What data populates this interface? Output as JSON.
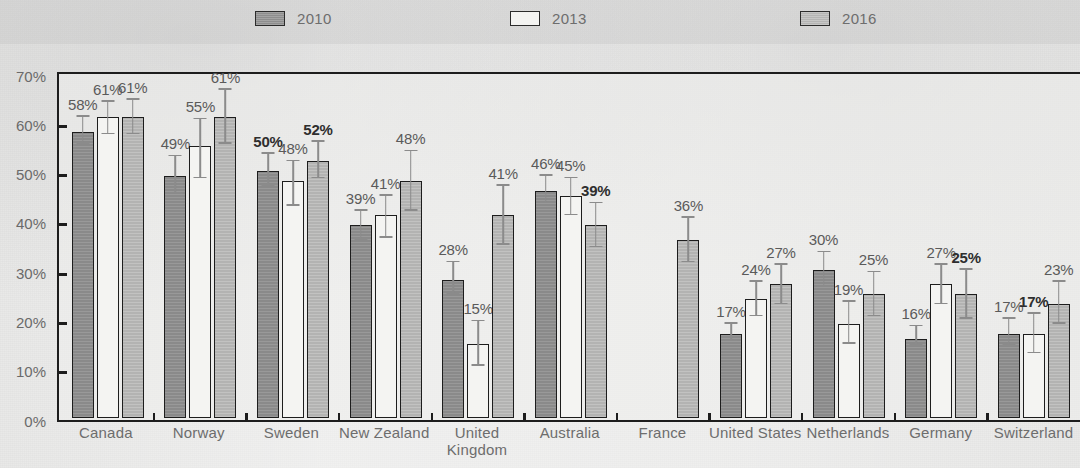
{
  "chart_data": {
    "type": "bar",
    "title": "",
    "subtitle": "",
    "xlabel": "",
    "ylabel": "",
    "ylim": [
      0,
      70
    ],
    "grid": false,
    "legend_position": "top",
    "y_ticks": [
      "0%",
      "10%",
      "20%",
      "30%",
      "40%",
      "50%",
      "60%",
      "70%"
    ],
    "y_tick_values": [
      0,
      10,
      20,
      30,
      40,
      50,
      60,
      70
    ],
    "categories": [
      "Canada",
      "Norway",
      "Sweden",
      "New Zealand",
      "United\nKingdom",
      "Australia",
      "France",
      "United States",
      "Netherlands",
      "Germany",
      "Switzerland"
    ],
    "series": [
      {
        "name": "2010",
        "color": "#8a8a8a",
        "values": [
          58,
          49,
          50,
          39,
          28,
          46,
          null,
          17,
          30,
          16,
          17
        ],
        "labels": [
          "58%",
          "49%",
          "50%",
          "39%",
          "28%",
          "46%",
          "",
          "17%",
          "30%",
          "16%",
          "17%"
        ],
        "err_low": [
          55.5,
          45.5,
          47,
          36,
          25,
          43.5,
          null,
          15.5,
          26.5,
          14.5,
          14.5
        ],
        "err_high": [
          61,
          53,
          53.5,
          42,
          31.5,
          49,
          null,
          19,
          33.5,
          18.5,
          20
        ]
      },
      {
        "name": "2013",
        "color": "#f4f4f2",
        "values": [
          61,
          55,
          48,
          41,
          15,
          45,
          null,
          24,
          19,
          27,
          17
        ],
        "labels": [
          "61%",
          "55%",
          "48%",
          "41%",
          "15%",
          "45%",
          "",
          "24%",
          "19%",
          "27%",
          "17%"
        ],
        "err_low": [
          57.5,
          48.5,
          43,
          36.5,
          10.5,
          41,
          null,
          20.5,
          15,
          23,
          13
        ],
        "err_high": [
          64,
          60.5,
          52,
          45,
          19.5,
          48.5,
          null,
          27.5,
          23.5,
          31,
          21
        ]
      },
      {
        "name": "2016",
        "color": "#b3b3b2",
        "values": [
          61,
          61,
          52,
          48,
          41,
          39,
          36,
          27,
          25,
          25,
          23
        ],
        "labels": [
          "61%",
          "61%",
          "52%",
          "48%",
          "41%",
          "39%",
          "36%",
          "27%",
          "25%",
          "25%",
          "23%"
        ],
        "err_low": [
          57.5,
          55.5,
          48.5,
          42,
          35,
          34.5,
          31.5,
          23,
          20.5,
          20,
          19
        ],
        "err_high": [
          64.5,
          66.5,
          56,
          54,
          47,
          43.5,
          40.5,
          31,
          29.5,
          30,
          27.5
        ]
      }
    ],
    "label_bold": {
      "Sweden": [
        "2010",
        "2016"
      ],
      "Australia": [
        "2016"
      ],
      "Germany": [
        "2016"
      ],
      "Switzerland": [
        "2013"
      ]
    }
  },
  "legend": {
    "items": [
      {
        "label": "2010",
        "swatch": "swatch-2010",
        "left_px": 255
      },
      {
        "label": "2013",
        "swatch": "swatch-2013",
        "left_px": 510
      },
      {
        "label": "2016",
        "swatch": "swatch-2016",
        "left_px": 800
      }
    ]
  },
  "axis": {
    "y_ticks": [
      "70%",
      "60%",
      "50%",
      "40%",
      "30%",
      "20%",
      "10%",
      "0%"
    ]
  },
  "xlabels": [
    {
      "line1": "Canada",
      "line2": ""
    },
    {
      "line1": "Norway",
      "line2": ""
    },
    {
      "line1": "Sweden",
      "line2": ""
    },
    {
      "line1": "New Zealand",
      "line2": ""
    },
    {
      "line1": "United",
      "line2": "Kingdom"
    },
    {
      "line1": "Australia",
      "line2": ""
    },
    {
      "line1": "France",
      "line2": ""
    },
    {
      "line1": "United States",
      "line2": ""
    },
    {
      "line1": "Netherlands",
      "line2": ""
    },
    {
      "line1": "Germany",
      "line2": ""
    },
    {
      "line1": "Switzerland",
      "line2": ""
    }
  ]
}
